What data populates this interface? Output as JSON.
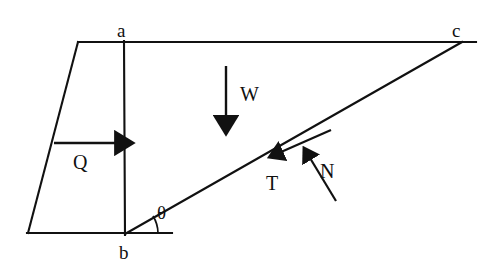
{
  "diagram": {
    "background_color": "#ffffff",
    "stroke_color": "#111111",
    "vertices": [
      {
        "id": "a",
        "label": "a",
        "x": 124,
        "y": 42,
        "label_x": 117,
        "label_y": 21
      },
      {
        "id": "b",
        "label": "b",
        "x": 125,
        "y": 234,
        "label_x": 119,
        "label_y": 243
      },
      {
        "id": "c",
        "label": "c",
        "x": 460,
        "y": 42,
        "label_x": 452,
        "label_y": 21
      }
    ],
    "angle": {
      "symbol": "θ",
      "label_x": 157,
      "label_y": 203,
      "vertex_x": 125,
      "vertex_y": 234,
      "arc_radius": 30
    },
    "forces": [
      {
        "id": "W",
        "label": "W",
        "description": "weight acting vertically downward",
        "label_x": 240,
        "label_y": 84,
        "x1": 226,
        "y1": 66,
        "x2": 226,
        "y2": 126
      },
      {
        "id": "Q",
        "label": "Q",
        "description": "horizontal driving force",
        "label_x": 73,
        "label_y": 152,
        "x1": 54,
        "y1": 143,
        "x2": 124,
        "y2": 143
      },
      {
        "id": "T",
        "label": "T",
        "description": "shear resistance along the failure plane",
        "label_x": 266,
        "label_y": 173,
        "x1": 330,
        "y1": 131,
        "x2": 272,
        "y2": 156
      },
      {
        "id": "N",
        "label": "N",
        "description": "normal force perpendicular to the failure plane",
        "label_x": 320,
        "label_y": 161,
        "x1": 335,
        "y1": 200,
        "x2": 304,
        "y2": 150
      }
    ],
    "edges": [
      {
        "id": "top-edge",
        "x1": 78,
        "y1": 42,
        "x2": 476,
        "y2": 42
      },
      {
        "id": "left-edge",
        "x1": 78,
        "y1": 42,
        "x2": 28,
        "y2": 233
      },
      {
        "id": "bottom-edge",
        "x1": 28,
        "y1": 233,
        "x2": 172,
        "y2": 233
      },
      {
        "id": "vertical-ab",
        "x1": 124,
        "y1": 42,
        "x2": 125,
        "y2": 234
      },
      {
        "id": "failure-plane-bc",
        "x1": 125,
        "y1": 234,
        "x2": 462,
        "y2": 42
      }
    ]
  }
}
